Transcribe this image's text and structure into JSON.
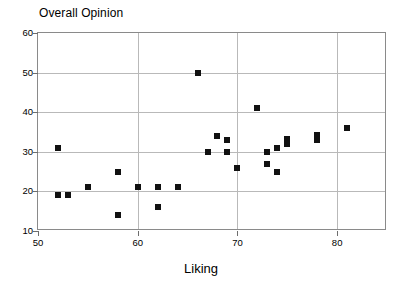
{
  "chart_data": {
    "type": "scatter",
    "title": "Overall Opinion",
    "xlabel": "Liking",
    "ylabel": "Overall Opinion",
    "xlim": [
      50,
      85
    ],
    "ylim": [
      10,
      60
    ],
    "xticks": [
      50,
      60,
      70,
      80
    ],
    "yticks": [
      10,
      20,
      30,
      40,
      50,
      60
    ],
    "xtick_labels": [
      "50",
      "60",
      "70",
      "80"
    ],
    "ytick_labels": [
      "10",
      "20",
      "30",
      "40",
      "50",
      "60"
    ],
    "grid": true,
    "legend": "none",
    "marker": "filled-square",
    "marker_color": "#111111",
    "points": [
      {
        "x": 52,
        "y": 31
      },
      {
        "x": 52,
        "y": 19
      },
      {
        "x": 53,
        "y": 19
      },
      {
        "x": 55,
        "y": 21
      },
      {
        "x": 58,
        "y": 25
      },
      {
        "x": 58,
        "y": 14
      },
      {
        "x": 60,
        "y": 21
      },
      {
        "x": 62,
        "y": 21
      },
      {
        "x": 62,
        "y": 16
      },
      {
        "x": 64,
        "y": 21
      },
      {
        "x": 66,
        "y": 50
      },
      {
        "x": 67,
        "y": 30
      },
      {
        "x": 68,
        "y": 34
      },
      {
        "x": 69,
        "y": 33
      },
      {
        "x": 69,
        "y": 30
      },
      {
        "x": 70,
        "y": 26
      },
      {
        "x": 72,
        "y": 41
      },
      {
        "x": 73,
        "y": 30
      },
      {
        "x": 73,
        "y": 27
      },
      {
        "x": 74,
        "y": 31
      },
      {
        "x": 74,
        "y": 25
      },
      {
        "x": 75,
        "y": 33
      },
      {
        "x": 75,
        "y": 32
      },
      {
        "x": 78,
        "y": 34
      },
      {
        "x": 78,
        "y": 33
      },
      {
        "x": 81,
        "y": 36
      }
    ]
  }
}
